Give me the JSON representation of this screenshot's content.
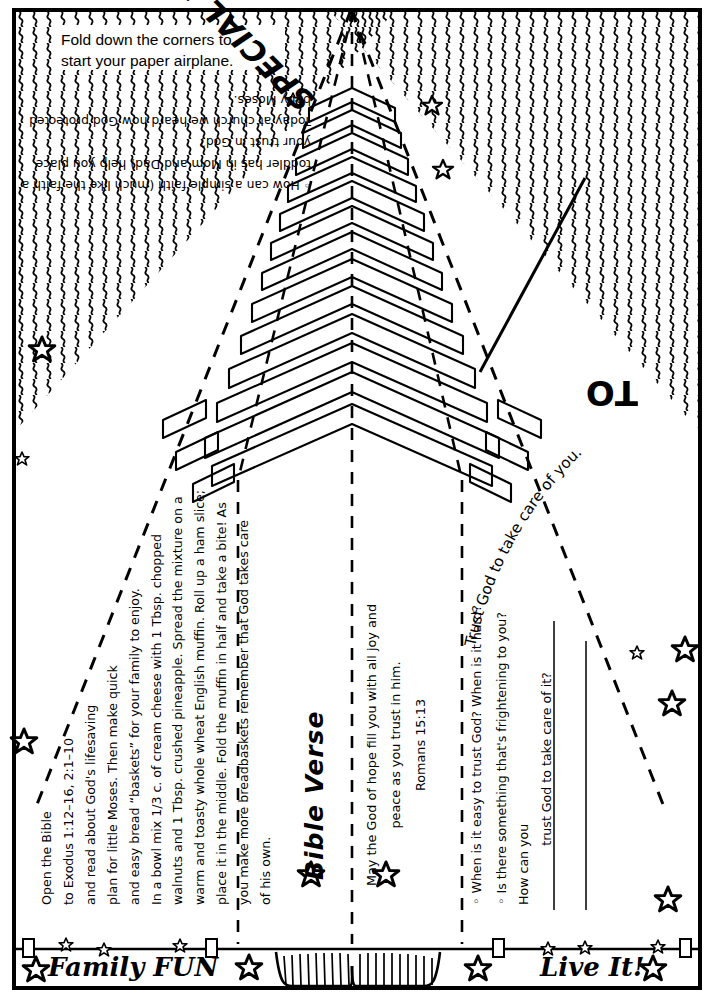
{
  "page": {
    "background_color": "#ffffff",
    "ink_color": "#000000"
  },
  "instruction_box": {
    "line1": "Fold down the corners to",
    "line2": "start your paper airplane."
  },
  "headline": {
    "text": "SPECIAL DELIVERY",
    "rotation_deg": 225
  },
  "address_label": {
    "text": "TO",
    "rotation_deg": 180
  },
  "arc_caption": {
    "text": "Trust God to take care of you."
  },
  "intro": {
    "question": "◦ How can a simple faith (much like the faith a toddler has in Mom and Dad) help you place your trust in God?",
    "paragraph": "Today at church we heard how God protected baby Moses."
  },
  "recipe": {
    "lines": [
      "Open the Bible",
      "to Exodus 1:12–16, 2:1–10",
      "and read about God's lifesaving",
      "plan for little Moses. Then make quick",
      "and easy bread “baskets” for your family to enjoy.",
      "In a bowl mix 1/3 c. of cream cheese with 1 Tbsp. chopped",
      "walnuts and 1 Tbsp. crushed pineapple. Spread the mixture on a",
      "warm and toasty whole wheat English muffin.  Roll up a ham slice;",
      "place it in the middle. Fold the muffin in half and take a bite! As",
      "you make more breadbaskets remember that God takes care",
      "of his own."
    ]
  },
  "bible_verse": {
    "title": "Bible Verse",
    "text_line1": "May the God of hope fill you with all joy and",
    "text_line2": "peace as you trust in him.",
    "reference": "Romans 15:13"
  },
  "questions": {
    "items": [
      "◦ When is it easy to trust God? When is it hard?",
      "◦ Is there something that's frightening to you? How can you",
      "trust God to take care of it?"
    ]
  },
  "banner": {
    "left_label": "Family FUN",
    "right_label": "Live It!"
  },
  "icons": {
    "star": "☆",
    "diamond_bullet": "◦"
  },
  "decor": {
    "zigzag_pattern": "vertical-squiggle-fill",
    "chevron_stack": "nested-chevron-arrows",
    "fold_lines": "dashed"
  }
}
